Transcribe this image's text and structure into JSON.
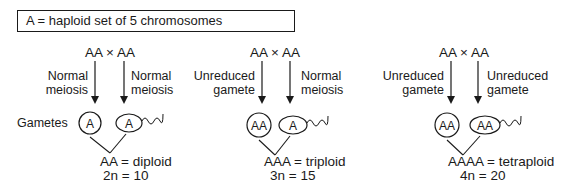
{
  "legend": {
    "text": "A = haploid set of 5 chromosomes"
  },
  "gametes_label": "Gametes",
  "crosses": [
    {
      "parents": "AA × AA",
      "left_process": [
        "Normal",
        "meiosis"
      ],
      "right_process": [
        "Normal",
        "meiosis"
      ],
      "egg_genotype": "A",
      "sperm_genotype": "A",
      "result_line1": "AA = diploid",
      "result_line2": "2n = 10"
    },
    {
      "parents": "AA × AA",
      "left_process": [
        "Unreduced",
        "gamete"
      ],
      "right_process": [
        "Normal",
        "meiosis"
      ],
      "egg_genotype": "AA",
      "sperm_genotype": "A",
      "result_line1": "AAA = triploid",
      "result_line2": "3n = 15"
    },
    {
      "parents": "AA × AA",
      "left_process": [
        "Unreduced",
        "gamete"
      ],
      "right_process": [
        "Unreduced",
        "gamete"
      ],
      "egg_genotype": "AA",
      "sperm_genotype": "AA",
      "result_line1": "AAAA = tetraploid",
      "result_line2": "4n = 20"
    }
  ]
}
